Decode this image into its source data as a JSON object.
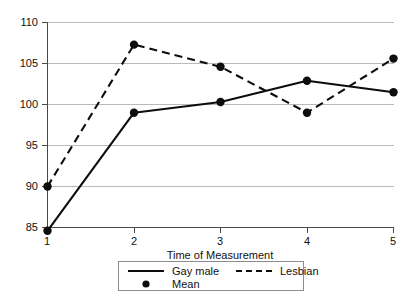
{
  "chart_data": {
    "type": "line",
    "title": "",
    "xlabel": "Time of Measurement",
    "ylabel": "",
    "x": [
      1,
      2,
      3,
      4,
      5
    ],
    "xticklabels": [
      "1",
      "2",
      "3",
      "4",
      "5"
    ],
    "yticklabels": [
      "85",
      "90",
      "95",
      "100",
      "105",
      "110"
    ],
    "yticks": [
      85,
      90,
      95,
      100,
      105,
      110
    ],
    "xlim": [
      1,
      5
    ],
    "ylim": [
      83.5,
      110
    ],
    "grid": "horizontal",
    "legend_position": "below-axes-center",
    "marker_label": "Mean",
    "series": [
      {
        "name": "Gay male",
        "style": "solid",
        "marker": "circle",
        "values": [
          84.6,
          99.0,
          100.3,
          102.9,
          101.5
        ]
      },
      {
        "name": "Lesbian",
        "style": "dashed",
        "marker": "circle",
        "values": [
          90.0,
          107.3,
          104.6,
          99.0,
          105.6
        ]
      }
    ],
    "colors": {
      "line": "#0d0d0d",
      "grid": "#b9b9b9",
      "axis": "#4a4a4a",
      "text": "#111111",
      "background": "#ffffff"
    }
  },
  "legend": {
    "entries": [
      {
        "label": "Gay male",
        "key": "solid-line"
      },
      {
        "label": "Lesbian",
        "key": "dashed-line"
      },
      {
        "label": "Mean",
        "key": "dot-marker"
      }
    ]
  },
  "axes": {
    "x_title": "Time of Measurement"
  }
}
